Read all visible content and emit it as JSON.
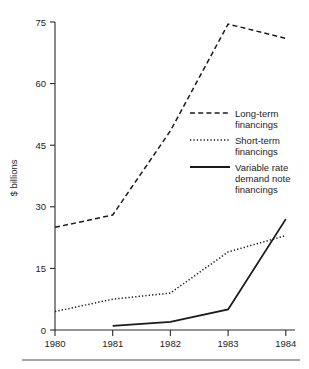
{
  "chart_data": {
    "type": "line",
    "title": "",
    "xlabel": "",
    "ylabel": "$ billions",
    "categories": [
      "1980",
      "1981",
      "1982",
      "1983",
      "1984"
    ],
    "x": [
      1980,
      1981,
      1982,
      1983,
      1984
    ],
    "xlim": [
      1980,
      1984
    ],
    "ylim": [
      0,
      75
    ],
    "yticks": [
      0,
      15,
      30,
      45,
      60,
      75
    ],
    "ytick_labels": [
      "0",
      "15",
      "30",
      "45",
      "60",
      "75"
    ],
    "xticks": [
      1980,
      1981,
      1982,
      1983,
      1984
    ],
    "xtick_labels": [
      "1980",
      "1981",
      "1982",
      "1983",
      "1984"
    ],
    "grid": false,
    "legend_position": "center-right",
    "series": [
      {
        "name": "Long-term financings",
        "style": "dashed",
        "color": "#1a1a1a",
        "values": [
          25,
          28,
          48.5,
          74.5,
          71
        ]
      },
      {
        "name": "Short-term financings",
        "style": "dotted",
        "color": "#1a1a1a",
        "values": [
          4.5,
          7.5,
          9,
          19,
          23
        ]
      },
      {
        "name": "Variable rate demand note financings",
        "style": "solid",
        "color": "#1a1a1a",
        "values": [
          null,
          1,
          2,
          5,
          27
        ]
      }
    ]
  },
  "axes": {
    "y_axis_title": "$ billions",
    "y_tick_labels": [
      "75",
      "60",
      "45",
      "30",
      "15",
      "0"
    ],
    "x_tick_labels": [
      "1980",
      "1981",
      "1982",
      "1983",
      "1984"
    ]
  },
  "legend": {
    "entries": [
      {
        "swatch": "dashed-line-swatch",
        "line1": "Long-term",
        "line2": "financings",
        "line3": ""
      },
      {
        "swatch": "dotted-line-swatch",
        "line1": "Short-term",
        "line2": "financings",
        "line3": ""
      },
      {
        "swatch": "solid-line-swatch",
        "line1": "Variable rate",
        "line2": "demand note",
        "line3": "financings"
      }
    ]
  },
  "footer": {
    "rule": "horizontal-rule",
    "caption_cutoff": ""
  },
  "colors": {
    "ink": "#1a1a1a",
    "axis": "#2b2b2b",
    "rule": "#4a4a4a",
    "background": "#ffffff"
  }
}
